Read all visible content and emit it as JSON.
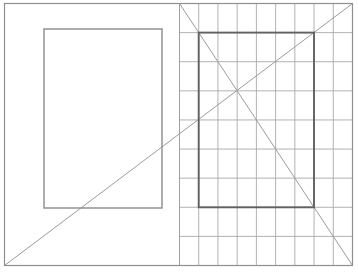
{
  "canvas": {
    "width": 358,
    "height": 277,
    "background": "#ffffff"
  },
  "colors": {
    "outer_border": "#8f8f8f",
    "half_divider": "#a0a0a0",
    "grid_line": "#a9a9a9",
    "plain_inner_rect": "#8a8a8a",
    "grid_inner_rect": "#616161",
    "diagonal": "#9c9c9c"
  },
  "figure": {
    "outer_rect": {
      "x": 4.5,
      "y": 3.5,
      "width": 348,
      "height": 262
    },
    "half_divider": {
      "x": 179.5,
      "y1": 3.5,
      "y2": 265.5
    },
    "left_panel": {
      "inner_rect": {
        "x": 44,
        "y": 29,
        "width": 118,
        "height": 179
      }
    },
    "right_panel": {
      "grid": {
        "x": 179.5,
        "y": 3.5,
        "width": 173,
        "height": 262,
        "columns": 9,
        "rows": 9
      },
      "inner_rect": {
        "x": 198.7,
        "y": 32.6,
        "width": 115.3,
        "height": 174.7
      }
    },
    "diagonals": [
      {
        "name": "main-diagonal",
        "x1": 4.5,
        "y1": 265.5,
        "x2": 352.5,
        "y2": 3.5
      },
      {
        "name": "right-half-diagonal",
        "x1": 179.5,
        "y1": 3.5,
        "x2": 352.5,
        "y2": 265.5
      }
    ]
  }
}
